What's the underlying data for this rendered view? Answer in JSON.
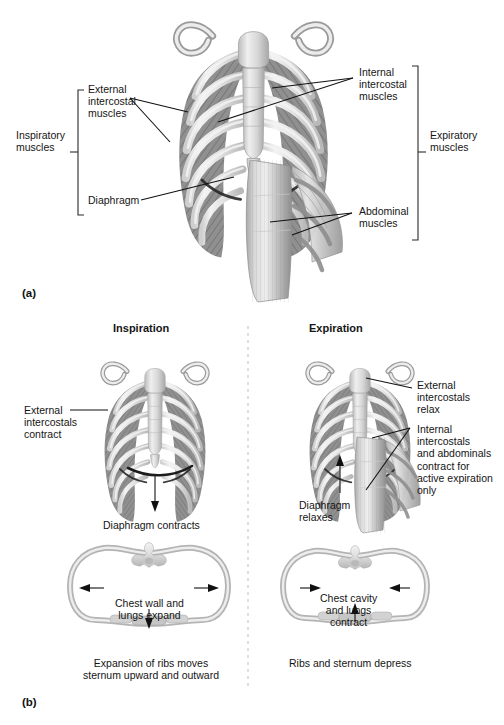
{
  "figure": {
    "title_a_tag": "(a)",
    "title_b_tag": "(b)",
    "background": "#ffffff",
    "ink": "#151515"
  },
  "panel_a": {
    "tag": "(a)",
    "brackets": [
      {
        "name": "inspiratory",
        "label": "Inspiratory\nmuscles",
        "side": "left"
      },
      {
        "name": "expiratory",
        "label": "Expiratory\nmuscles",
        "side": "right"
      }
    ],
    "labels": [
      {
        "name": "external-intercostal-muscles",
        "text": "External\nintercostal\nmuscles"
      },
      {
        "name": "diaphragm",
        "text": "Diaphragm"
      },
      {
        "name": "internal-intercostal-muscles",
        "text": "Internal\nintercostal\nmuscles"
      },
      {
        "name": "abdominal-muscles",
        "text": "Abdominal\nmuscles"
      }
    ],
    "inspiratory_label": "Inspiratory\nmuscles",
    "expiratory_label": "Expiratory\nmuscles",
    "external_intercostal_label": "External\nintercostal\nmuscles",
    "diaphragm_label": "Diaphragm",
    "internal_intercostal_label": "Internal\nintercostal\nmuscles",
    "abdominal_label": "Abdominal\nmuscles"
  },
  "panel_b": {
    "tag": "(b)",
    "inspiration": {
      "heading": "Inspiration",
      "external_label": "External\nintercostals\ncontract",
      "diaphragm_caption": "Diaphragm contracts",
      "cross_section_text": "Chest wall and\nlungs expand",
      "cross_section_caption": "Expansion of ribs moves\nsternum upward and outward"
    },
    "expiration": {
      "heading": "Expiration",
      "external_label": "External\nintercostals\nrelax",
      "internal_label": "Internal\nintercostals\nand abdominals\ncontract for\nactive expiration\nonly",
      "diaphragm_caption": "Diaphragm\nrelaxes",
      "cross_section_text": "Chest cavity\nand lungs\ncontract",
      "cross_section_caption": "Ribs and sternum depress"
    }
  }
}
